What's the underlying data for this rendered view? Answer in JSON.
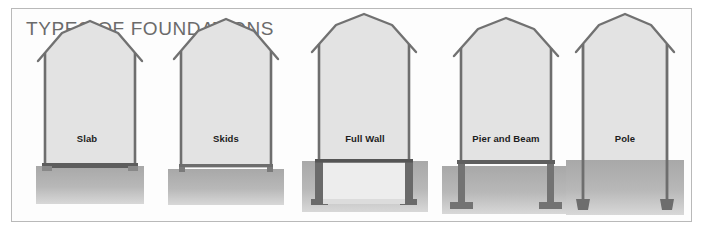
{
  "figure": {
    "title": "TYPES OF FOUNDATIONS",
    "border_color": "#b9b9b9",
    "background_color": "#ffffff",
    "title_color": "#6b6b6b",
    "wall_fill": "#e2e2e2",
    "ground_fill": "#b4b4b4",
    "structure_outline": "#6b6b6b",
    "footing_fill": "#8e8e8e"
  },
  "panels": [
    {
      "id": "slab",
      "label": "Slab",
      "description": "Barn shape resting directly on a thin concrete slab at grade",
      "label_x": 0,
      "label_y": 128
    },
    {
      "id": "skids",
      "label": "Skids",
      "description": "Barn shape resting on short skid blocks set on grade",
      "label_x": 0,
      "label_y": 128
    },
    {
      "id": "full-wall",
      "label": "Full Wall",
      "description": "Barn shape over a full perimeter foundation wall with footings below grade",
      "label_x": 0,
      "label_y": 128
    },
    {
      "id": "pier-and-beam",
      "label": "Pier and Beam",
      "description": "Barn shape raised on piers with spread footings below grade",
      "label_x": 0,
      "label_y": 128
    },
    {
      "id": "pole",
      "label": "Pole",
      "description": "Barn shape supported on poles driven deep below grade onto pads",
      "label_x": 0,
      "label_y": 128
    }
  ]
}
